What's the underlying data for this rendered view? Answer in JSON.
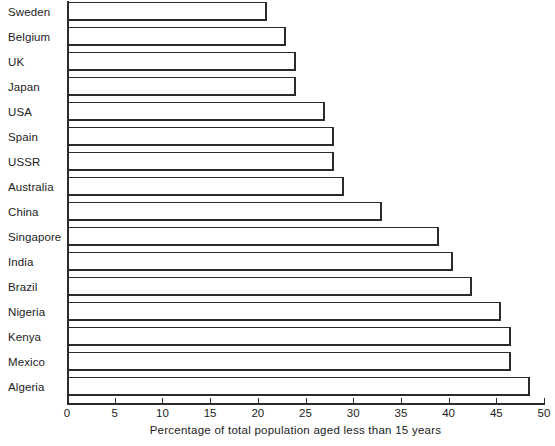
{
  "chart_data": {
    "type": "bar",
    "orientation": "horizontal",
    "title": "",
    "xlabel": "Percentage of total population aged less than 15 years",
    "ylabel": "",
    "xlim": [
      0,
      50
    ],
    "xticks": [
      0,
      5,
      10,
      15,
      20,
      25,
      30,
      35,
      40,
      45,
      50
    ],
    "xtick_labels": [
      "0",
      "5",
      "10",
      "15",
      "20",
      "25",
      "30",
      "35",
      "40",
      "45",
      "50"
    ],
    "grid": false,
    "legend": null,
    "categories": [
      "Sweden",
      "Belgium",
      "UK",
      "Japan",
      "USA",
      "Spain",
      "USSR",
      "Australia",
      "China",
      "Singapore",
      "India",
      "Brazil",
      "Nigeria",
      "Kenya",
      "Mexico",
      "Algeria"
    ],
    "values": [
      21,
      23,
      24,
      24,
      27,
      28,
      28,
      29,
      33,
      39,
      40.5,
      42.5,
      45.5,
      46.5,
      46.5,
      48.5
    ],
    "bar_face_color": "#ffffff",
    "bar_edge_color": "#2b2b2b",
    "axis_color": "#2b2b2b",
    "background_color": "#ffffff"
  }
}
